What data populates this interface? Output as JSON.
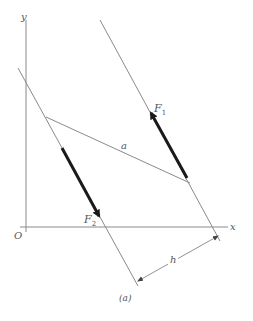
{
  "figure": {
    "caption": "(a)",
    "colors": {
      "thin_line": "#8a8a8a",
      "force": "#1a1a1a",
      "text": "#555555",
      "background": "#ffffff"
    }
  },
  "axes": {
    "origin_label": "O",
    "x_label": "x",
    "y_label": "y"
  },
  "lines": {
    "line_of_action_1": {
      "x1": 100,
      "y1": 20,
      "x2": 220,
      "y2": 241
    },
    "line_of_action_2": {
      "x1": 18,
      "y1": 68,
      "x2": 138,
      "y2": 286
    },
    "segment_a": {
      "x1": 46,
      "y1": 117,
      "x2": 190,
      "y2": 183
    }
  },
  "forces": [
    {
      "label": "F",
      "subscript": "1",
      "x1": 187,
      "y1": 178,
      "x2": 149,
      "y2": 110
    },
    {
      "label": "F",
      "subscript": "2",
      "x1": 62,
      "y1": 148,
      "x2": 101,
      "y2": 219
    }
  ],
  "labels": {
    "a": "a",
    "h": "h",
    "F1_main": "F",
    "F1_sub": "1",
    "F2_main": "F",
    "F2_sub": "2"
  },
  "dimension": {
    "label": "h",
    "x1": 138,
    "y1": 281,
    "x2": 218,
    "y2": 236
  }
}
